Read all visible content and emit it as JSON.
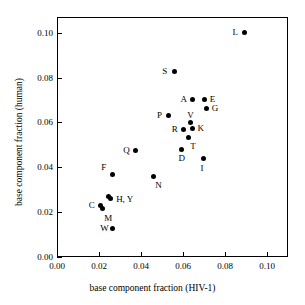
{
  "chart_data": {
    "type": "scatter",
    "title": "",
    "xlabel": "base component fraction (HIV-1)",
    "ylabel": "base component fraction (human)",
    "xlim": [
      0.0,
      0.11
    ],
    "ylim": [
      0.0,
      0.107
    ],
    "xticks": [
      "0.00",
      "0.02",
      "0.04",
      "0.06",
      "0.08",
      "0.10"
    ],
    "xtickvalues": [
      0.0,
      0.02,
      0.04,
      0.06,
      0.08,
      0.1
    ],
    "yticks": [
      "0.00",
      "0.02",
      "0.04",
      "0.06",
      "0.08",
      "0.10"
    ],
    "ytickvalues": [
      0.0,
      0.02,
      0.04,
      0.06,
      0.08,
      0.1
    ],
    "grid": false,
    "legend": null,
    "marker": "filled-circle",
    "marker_color": "#000000",
    "points": [
      {
        "label": "L",
        "x": 0.0893,
        "y": 0.1,
        "label_pos": "left"
      },
      {
        "label": "S",
        "x": 0.0558,
        "y": 0.0828,
        "label_pos": "left"
      },
      {
        "label": "A",
        "x": 0.0645,
        "y": 0.0702,
        "label_pos": "left"
      },
      {
        "label": "E",
        "x": 0.0703,
        "y": 0.0702,
        "label_pos": "right"
      },
      {
        "label": "G",
        "x": 0.0713,
        "y": 0.066,
        "label_pos": "right"
      },
      {
        "label": "P",
        "x": 0.0533,
        "y": 0.063,
        "label_pos": "left"
      },
      {
        "label": "V",
        "x": 0.0635,
        "y": 0.0598,
        "label_pos": "above"
      },
      {
        "label": "R",
        "x": 0.0603,
        "y": 0.0568,
        "label_pos": "left"
      },
      {
        "label": "K",
        "x": 0.0645,
        "y": 0.0572,
        "label_pos": "right"
      },
      {
        "label": "T",
        "x": 0.0625,
        "y": 0.0535,
        "label_pos": "below-right"
      },
      {
        "label": "D",
        "x": 0.0593,
        "y": 0.048,
        "label_pos": "below"
      },
      {
        "label": "I",
        "x": 0.0698,
        "y": 0.0437,
        "label_pos": "below"
      },
      {
        "label": "Q",
        "x": 0.0373,
        "y": 0.0475,
        "label_pos": "left"
      },
      {
        "label": "F",
        "x": 0.0263,
        "y": 0.0368,
        "label_pos": "upper-left"
      },
      {
        "label": "N",
        "x": 0.0458,
        "y": 0.036,
        "label_pos": "below-right"
      },
      {
        "label": "H",
        "x": 0.0243,
        "y": 0.0268,
        "label_pos": "right-pair"
      },
      {
        "label": "Y",
        "x": 0.0253,
        "y": 0.0262,
        "label_pos": "right-pair"
      },
      {
        "label": "C",
        "x": 0.0208,
        "y": 0.0228,
        "label_pos": "left"
      },
      {
        "label": "M",
        "x": 0.0215,
        "y": 0.0215,
        "label_pos": "below-right"
      },
      {
        "label": "W",
        "x": 0.0263,
        "y": 0.0128,
        "label_pos": "left"
      }
    ],
    "label_groups": [
      {
        "text": "H, Y",
        "x": 0.0253,
        "y": 0.0262
      }
    ]
  },
  "axes": {
    "x_label": "base component fraction (HIV-1)",
    "y_label": "base component fraction (human)"
  }
}
